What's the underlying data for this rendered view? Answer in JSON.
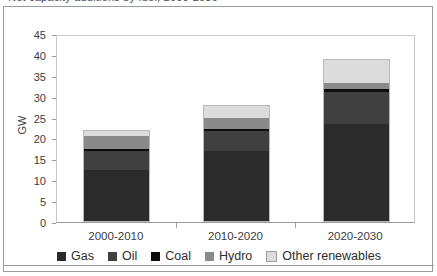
{
  "title_fragment": "Net capacity additions by fuel, 2000-2030",
  "chart_data": {
    "type": "bar",
    "subtype": "stacked-vertical",
    "title": "",
    "xlabel": "",
    "ylabel": "GW",
    "ylim": [
      0,
      45
    ],
    "ytick_step": 5,
    "ytick_labels": [
      "0",
      "5",
      "10",
      "15",
      "20",
      "25",
      "30",
      "35",
      "40",
      "45"
    ],
    "grid": false,
    "legend_position": "bottom",
    "categories": [
      "2000-2010",
      "2010-2020",
      "2020-2030"
    ],
    "series": [
      {
        "name": "Gas",
        "color": "#2b2b2b",
        "values": [
          12.5,
          17.0,
          23.5
        ]
      },
      {
        "name": "Oil",
        "color": "#404040",
        "values": [
          4.5,
          4.8,
          7.7
        ]
      },
      {
        "name": "Coal",
        "color": "#0d0d0d",
        "values": [
          0.4,
          0.5,
          0.6
        ]
      },
      {
        "name": "Hydro",
        "color": "#8a8a8a",
        "values": [
          3.3,
          2.7,
          1.5
        ]
      },
      {
        "name": "Other renewables",
        "color": "#dcdcdc",
        "values": [
          1.3,
          3.0,
          5.7
        ]
      }
    ],
    "totals": [
      22.0,
      28.0,
      39.0
    ]
  },
  "axis": {
    "y_title": "GW"
  },
  "legend": {
    "items": [
      {
        "label": "Gas",
        "color": "#2b2b2b"
      },
      {
        "label": "Oil",
        "color": "#404040"
      },
      {
        "label": "Coal",
        "color": "#0d0d0d"
      },
      {
        "label": "Hydro",
        "color": "#8a8a8a"
      },
      {
        "label": "Other renewables",
        "color": "#dcdcdc"
      }
    ]
  }
}
